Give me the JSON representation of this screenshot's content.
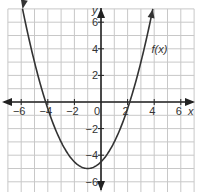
{
  "chart_data": {
    "type": "line",
    "title": "",
    "xlabel": "x",
    "ylabel": "y",
    "xlim": [
      -7,
      7
    ],
    "ylim": [
      -7,
      7
    ],
    "grid": true,
    "x_ticks": [
      "-6",
      "-4",
      "-2",
      "0",
      "2",
      "4",
      "6"
    ],
    "y_ticks": [
      "6",
      "4",
      "2",
      "-2",
      "-4",
      "-6"
    ],
    "series": [
      {
        "name": "f(x)",
        "equation": "f(x) = 0.5(x+1)^2 - 5",
        "vertex": [
          -1,
          -5
        ],
        "roots": [
          -4.16,
          2.16
        ],
        "y_intercept": -4.5,
        "x": [
          -4.8,
          -4,
          -3,
          -2,
          -1,
          0,
          1,
          2,
          2.8
        ],
        "values": [
          2.2,
          -0.5,
          -3,
          -4.5,
          -5,
          -4.5,
          -3,
          -0.5,
          2.2
        ]
      }
    ],
    "annotations": [
      {
        "text": "f(x)",
        "x": 4.2,
        "y": 4
      }
    ]
  },
  "labels": {
    "curve": "f(x)",
    "x_axis": "x",
    "y_axis": "y",
    "origin": "0"
  }
}
